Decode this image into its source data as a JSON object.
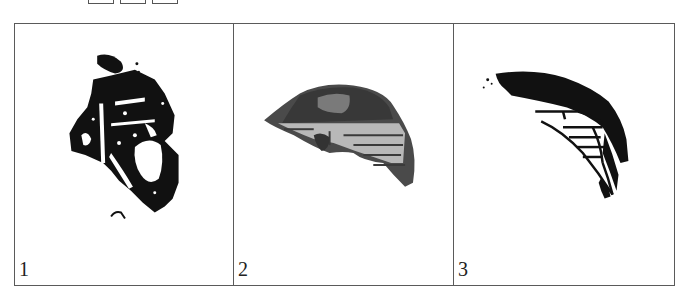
{
  "header_fragment": {
    "visible": "partial glyph and three boxed characters cropped at top edge",
    "boxes": 3
  },
  "figure": {
    "panels": [
      {
        "label": "1",
        "description": "Black-and-white thresholded specimen image, irregular dark fragment"
      },
      {
        "label": "2",
        "description": "Grayscale specimen image, half-lens shaped fragment with horizontal striations"
      },
      {
        "label": "3",
        "description": "Black-and-white thresholded specimen image, curved crescent fragment with horizontal striations"
      }
    ]
  },
  "colors": {
    "border": "#5a5a5a",
    "ink": "#111111",
    "gray": "#4a4a4a",
    "light_gray": "#b8b8b8"
  }
}
